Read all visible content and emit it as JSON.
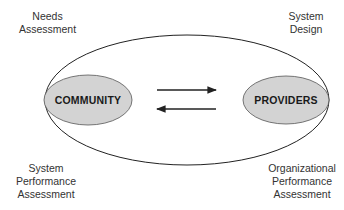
{
  "diagram": {
    "nodes": {
      "community": {
        "label": "COMMUNITY",
        "fill": "#d3d3d3"
      },
      "providers": {
        "label": "PROVIDERS",
        "fill": "#d3d3d3"
      }
    },
    "corner_labels": {
      "top_left": {
        "line1": "Needs",
        "line2": "Assessment"
      },
      "top_right": {
        "line1": "System",
        "line2": "Design"
      },
      "bottom_left": {
        "line1": "System",
        "line2": "Performance",
        "line3": "Assessment"
      },
      "bottom_right": {
        "line1": "Organizational",
        "line2": "Performance",
        "line3": "Assessment"
      }
    },
    "arrows": [
      {
        "from": "community",
        "to": "providers",
        "direction": "right"
      },
      {
        "from": "providers",
        "to": "community",
        "direction": "left"
      }
    ],
    "colors": {
      "outline": "#222222",
      "node_fill": "#d3d3d3",
      "text": "#333333"
    }
  }
}
